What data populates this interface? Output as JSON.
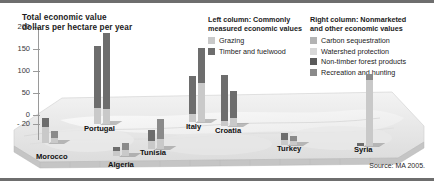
{
  "chart": {
    "title_line1": "Total economic value",
    "title_line2": "dollars per hectare per year",
    "source": "Source: MA 2005.",
    "y_ticks": [
      "200",
      "150",
      "100",
      "50",
      "0",
      "- 20"
    ]
  },
  "legend": {
    "left": {
      "heading_line1": "Left column: Commonly",
      "heading_line2": "measured economic values",
      "items": [
        {
          "label": "Grazing",
          "color": "#c9c9c9"
        },
        {
          "label": "Timber and fuelwood",
          "color": "#6d6d6d"
        }
      ]
    },
    "right": {
      "heading_line1": "Right column: Nonmarketed",
      "heading_line2": "and other economic values",
      "items": [
        {
          "label": "Carbon sequestration",
          "color": "#b3b3b3"
        },
        {
          "label": "Watershed protection",
          "color": "#d8d8d8"
        },
        {
          "label": "Non-timber forest products",
          "color": "#5a5a5a"
        },
        {
          "label": "Recreation and hunting",
          "color": "#8a8a8a"
        }
      ]
    }
  },
  "chart_data": {
    "type": "bar",
    "subtitle": "Left column: Commonly measured economic values; Right column: Nonmarketed and other economic values",
    "xlabel": "",
    "ylabel": "dollars per hectare per year",
    "ylim": [
      -20,
      200
    ],
    "yticks": [
      -20,
      0,
      50,
      100,
      150,
      200
    ],
    "grid": false,
    "legend_position": "top-right",
    "stacked": true,
    "categories": [
      "Morocco",
      "Algeria",
      "Tunisia",
      "Portugal",
      "Italy",
      "Croatia",
      "Turkey",
      "Syria"
    ],
    "series": [
      {
        "name": "Grazing",
        "column": "left",
        "color": "#c9c9c9",
        "values": [
          22,
          7,
          11,
          33,
          16,
          10,
          9,
          0
        ]
      },
      {
        "name": "Timber and fuelwood",
        "column": "left",
        "color": "#6d6d6d",
        "values": [
          12,
          4,
          6,
          131,
          79,
          97,
          14,
          4
        ]
      },
      {
        "name": "Carbon sequestration",
        "column": "right",
        "color": "#b3b3b3",
        "values": [
          6,
          5,
          8,
          31,
          82,
          11,
          6,
          170
        ]
      },
      {
        "name": "Watershed protection",
        "column": "right",
        "color": "#d8d8d8",
        "values": [
          4,
          3,
          5,
          0,
          10,
          5,
          3,
          8
        ]
      },
      {
        "name": "Non-timber forest products",
        "column": "right",
        "color": "#5a5a5a",
        "values": [
          9,
          9,
          22,
          162,
          74,
          57,
          9,
          3
        ]
      },
      {
        "name": "Recreation and hunting",
        "column": "right",
        "color": "#8a8a8a",
        "values": [
          3,
          2,
          4,
          0,
          6,
          4,
          2,
          4
        ]
      }
    ],
    "column_totals": {
      "left": [
        34,
        11,
        17,
        164,
        95,
        107,
        23,
        4
      ],
      "right": [
        22,
        19,
        39,
        193,
        172,
        77,
        20,
        185
      ]
    },
    "negative_values": {
      "Turkey": -8,
      "Algeria": -3
    }
  },
  "countries": [
    {
      "name": "Morocco",
      "label_left": 36,
      "label_top": 152,
      "group_left": 42,
      "group_bottom": 38,
      "left_col": [
        {
          "h": 9,
          "color": "#6d6d6d"
        },
        {
          "h": 16,
          "color": "#c9c9c9"
        }
      ],
      "right_col": [
        {
          "h": 7,
          "color": "#8a8a8a"
        },
        {
          "h": 5,
          "color": "#c9c9c9"
        }
      ]
    },
    {
      "name": "Algeria",
      "label_left": 108,
      "label_top": 160,
      "group_left": 113,
      "group_bottom": 25,
      "left_col": [
        {
          "h": 4,
          "color": "#6d6d6d"
        },
        {
          "h": 5,
          "color": "#c9c9c9"
        }
      ],
      "right_col": [
        {
          "h": 7,
          "color": "#8a8a8a"
        },
        {
          "h": 6,
          "color": "#c9c9c9"
        }
      ]
    },
    {
      "name": "Tunisia",
      "label_left": 140,
      "label_top": 148,
      "group_left": 148,
      "group_bottom": 32,
      "left_col": [
        {
          "h": 11,
          "color": "#6d6d6d"
        },
        {
          "h": 8,
          "color": "#c9c9c9"
        }
      ],
      "right_col": [
        {
          "h": 20,
          "color": "#8a8a8a"
        },
        {
          "h": 10,
          "color": "#c9c9c9"
        }
      ]
    },
    {
      "name": "Portugal",
      "label_left": 84,
      "label_top": 124,
      "group_left": 94,
      "group_bottom": 57,
      "left_col": [
        {
          "h": 62,
          "color": "#6d6d6d"
        },
        {
          "h": 16,
          "color": "#c9c9c9"
        }
      ],
      "right_col": [
        {
          "h": 76,
          "color": "#6d6d6d"
        },
        {
          "h": 15,
          "color": "#c9c9c9"
        }
      ]
    },
    {
      "name": "Italy",
      "label_left": 186,
      "label_top": 122,
      "group_left": 189,
      "group_bottom": 59,
      "left_col": [
        {
          "h": 38,
          "color": "#6d6d6d"
        },
        {
          "h": 8,
          "color": "#c9c9c9"
        }
      ],
      "right_col": [
        {
          "h": 35,
          "color": "#6d6d6d"
        },
        {
          "h": 39,
          "color": "#c9c9c9"
        }
      ]
    },
    {
      "name": "Croatia",
      "label_left": 215,
      "label_top": 126,
      "group_left": 221,
      "group_bottom": 55,
      "left_col": [
        {
          "h": 46,
          "color": "#6d6d6d"
        },
        {
          "h": 5,
          "color": "#c9c9c9"
        }
      ],
      "right_col": [
        {
          "h": 27,
          "color": "#6d6d6d"
        },
        {
          "h": 8,
          "color": "#c9c9c9"
        }
      ]
    },
    {
      "name": "Turkey",
      "label_left": 277,
      "label_top": 144,
      "group_left": 281,
      "group_bottom": 36,
      "left_col": [
        {
          "h": 7,
          "color": "#6d6d6d"
        },
        {
          "h": 5,
          "color": "#c9c9c9"
        }
      ],
      "right_col": [
        {
          "h": 5,
          "color": "#8a8a8a"
        },
        {
          "h": 4,
          "color": "#c9c9c9"
        }
      ]
    },
    {
      "name": "Syria",
      "label_left": 354,
      "label_top": 145,
      "group_left": 357,
      "group_bottom": 35,
      "left_col": [
        {
          "h": 3,
          "color": "#6d6d6d"
        }
      ],
      "right_col": [
        {
          "h": 6,
          "color": "#8a8a8a"
        },
        {
          "h": 66,
          "color": "#c9c9c9"
        }
      ]
    }
  ]
}
